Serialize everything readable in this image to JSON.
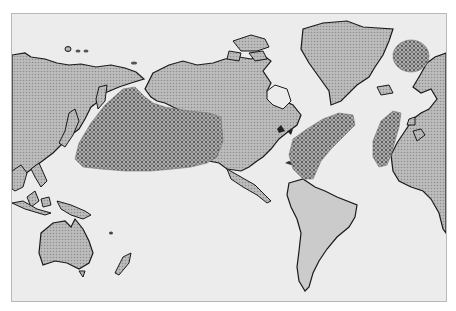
{
  "map": {
    "type": "world-map-pacific-centered",
    "style": "grayscale halftone",
    "colors": {
      "ocean": "#ececec",
      "land": "#b4b4b4",
      "outline": "#1a1a1a",
      "stipple_region": "#8a8a8a",
      "frame": "#b8b8b8"
    },
    "regions": [
      {
        "name": "North Pacific stippled region"
      },
      {
        "name": "Western North Atlantic stippled region"
      },
      {
        "name": "Eastern North Atlantic stippled region"
      },
      {
        "name": "Norwegian Sea stippled region"
      }
    ]
  }
}
